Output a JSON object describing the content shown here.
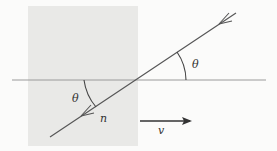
{
  "diagram": {
    "type": "physics-refraction-moving-medium",
    "labels": {
      "theta_upper": "θ",
      "theta_lower": "θ",
      "n": "n",
      "v": "v"
    },
    "colors": {
      "background": "#fbfbfa",
      "medium": "#e9e9e7",
      "line": "#555555",
      "interface": "#9a9a9a"
    }
  }
}
